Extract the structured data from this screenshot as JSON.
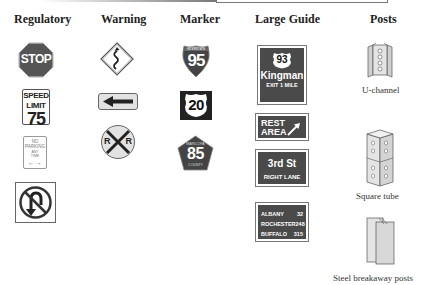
{
  "columns": [
    {
      "key": "regulatory",
      "header": "Regulatory"
    },
    {
      "key": "warning",
      "header": "Warning"
    },
    {
      "key": "marker",
      "header": "Marker"
    },
    {
      "key": "large_guide",
      "header": "Large Guide"
    },
    {
      "key": "posts",
      "header": "Posts"
    }
  ],
  "regulatory": {
    "stop": {
      "text": "STOP",
      "color": "#555555"
    },
    "speed_limit": {
      "line1": "SPEED",
      "line2": "LIMIT",
      "value": "75"
    },
    "no_parking": {
      "line1": "NO",
      "line2": "PARKING",
      "line3": "ANY",
      "line4": "TIME",
      "arrow": "←→"
    },
    "no_u_turn": {
      "icon": "no-u-turn-icon"
    }
  },
  "warning": {
    "winding_road": {
      "icon": "winding-road-icon"
    },
    "left_arrow": {
      "icon": "left-arrow-icon"
    },
    "railroad_crossing": {
      "left": "R",
      "right": "R"
    }
  },
  "marker": {
    "interstate": {
      "banner": "INTERSTATE",
      "number": "95"
    },
    "us_route": {
      "number": "20"
    },
    "county": {
      "top": "MARICOPA",
      "number": "85",
      "bottom": "COUNTY"
    }
  },
  "large_guide": {
    "exit_sign": {
      "route": "93",
      "city": "Kingman",
      "exit": "EXIT 1 MILE"
    },
    "rest_area": {
      "line1": "REST",
      "line2": "AREA"
    },
    "street": {
      "name": "3rd St",
      "lane": "RIGHT LANE"
    },
    "distances": [
      {
        "city": "ALBANY",
        "miles": "32"
      },
      {
        "city": "ROCHESTER",
        "miles": "248"
      },
      {
        "city": "BUFFALO",
        "miles": "315"
      }
    ],
    "color": "#4a4a4a"
  },
  "posts": {
    "u_channel": "U-channel",
    "square_tube": "Square tube",
    "breakaway": "Steel breakaway posts"
  }
}
